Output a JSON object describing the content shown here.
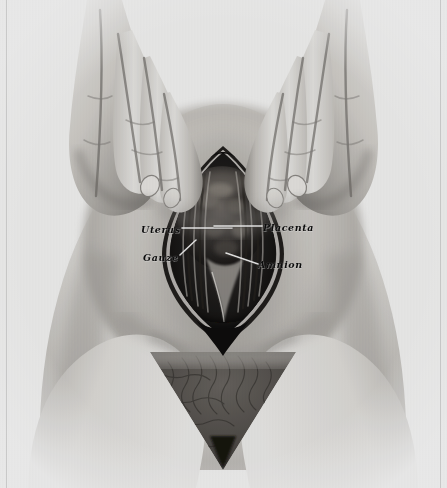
{
  "plate": {
    "kind": "medical-illustration",
    "subject": "Caesarean section — uterine incision with hands supporting the gravid abdomen",
    "technique": "halftone-printed pen-and-wash drawing",
    "palette": {
      "paper": "#fbfbfa",
      "skin_light": "#ededea",
      "skin_mid": "#c9c7c2",
      "skin_shadow": "#8e8c88",
      "deep_shadow": "#4a4846",
      "incision_dark": "#141312",
      "leader_line": "#ffffff",
      "label_text": "#0d0d0d"
    }
  },
  "labels": [
    {
      "id": "uterus",
      "text": "Uterus",
      "side": "left",
      "position": "upper"
    },
    {
      "id": "gauze",
      "text": "Gauze",
      "side": "left",
      "position": "lower"
    },
    {
      "id": "placenta",
      "text": "Placenta",
      "side": "right",
      "position": "upper"
    },
    {
      "id": "amnion",
      "text": "Amnion",
      "side": "right",
      "position": "lower"
    }
  ],
  "figure_elements": {
    "hands": "two hands, fingers curved downward and inward, resting on either side of the abdomen",
    "abdomen": "distended gravid abdomen filling the centre of the plate",
    "incision": "vertical lens-shaped uterine opening with layered dark margins",
    "contents": "mottled dark placental tissue and membranes within the opening",
    "pubic_region": "dark textured triangle at the lower centre"
  }
}
